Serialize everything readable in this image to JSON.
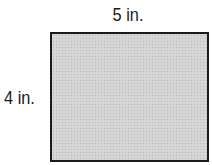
{
  "diagram": {
    "shape": "rectangle",
    "fill_color": "#d4d4d4",
    "border_color": "#1a1a1a",
    "width_label": "5 in.",
    "height_label": "4 in."
  }
}
